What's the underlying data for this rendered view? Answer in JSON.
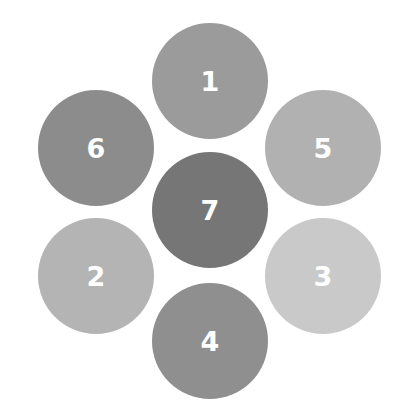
{
  "diagram": {
    "circles": [
      {
        "label": "1",
        "cx": 210,
        "cy": 81,
        "r": 58,
        "color": "#9b9b9b"
      },
      {
        "label": "6",
        "cx": 96,
        "cy": 148,
        "r": 58,
        "color": "#8c8c8c"
      },
      {
        "label": "5",
        "cx": 323,
        "cy": 148,
        "r": 58,
        "color": "#b1b1b1"
      },
      {
        "label": "7",
        "cx": 210,
        "cy": 210,
        "r": 58,
        "color": "#767676"
      },
      {
        "label": "2",
        "cx": 96,
        "cy": 276,
        "r": 58,
        "color": "#b4b4b4"
      },
      {
        "label": "3",
        "cx": 323,
        "cy": 276,
        "r": 58,
        "color": "#c9c9c9"
      },
      {
        "label": "4",
        "cx": 210,
        "cy": 341,
        "r": 58,
        "color": "#8f8f8f"
      }
    ]
  }
}
